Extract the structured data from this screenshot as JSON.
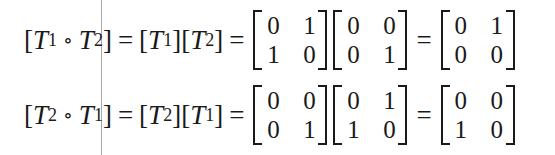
{
  "equations": [
    {
      "lhs": {
        "open": "[",
        "a_sym": "T",
        "a_sub": "1",
        "compose": "∘",
        "b_sym": "T",
        "b_sub": "2",
        "close": "]",
        "eq1": "=",
        "p1_open": "[",
        "p1_sym": "T",
        "p1_sub": "1",
        "p1_close": "]",
        "p2_open": "[",
        "p2_sym": "T",
        "p2_sub": "2",
        "p2_close": "]",
        "eq2": "="
      },
      "matrices": [
        {
          "cells": [
            [
              "0",
              "1"
            ],
            [
              "1",
              "0"
            ]
          ]
        },
        {
          "cells": [
            [
              "0",
              "0"
            ],
            [
              "0",
              "1"
            ]
          ]
        },
        {
          "cells": [
            [
              "0",
              "1"
            ],
            [
              "0",
              "0"
            ]
          ]
        }
      ],
      "eq3": "="
    },
    {
      "lhs": {
        "open": "[",
        "a_sym": "T",
        "a_sub": "2",
        "compose": "∘",
        "b_sym": "T",
        "b_sub": "1",
        "close": "]",
        "eq1": "=",
        "p1_open": "[",
        "p1_sym": "T",
        "p1_sub": "2",
        "p1_close": "]",
        "p2_open": "[",
        "p2_sym": "T",
        "p2_sub": "1",
        "p2_close": "]",
        "eq2": "="
      },
      "matrices": [
        {
          "cells": [
            [
              "0",
              "0"
            ],
            [
              "0",
              "1"
            ]
          ]
        },
        {
          "cells": [
            [
              "0",
              "1"
            ],
            [
              "1",
              "0"
            ]
          ]
        },
        {
          "cells": [
            [
              "0",
              "0"
            ],
            [
              "1",
              "0"
            ]
          ]
        }
      ],
      "eq3": "="
    }
  ]
}
